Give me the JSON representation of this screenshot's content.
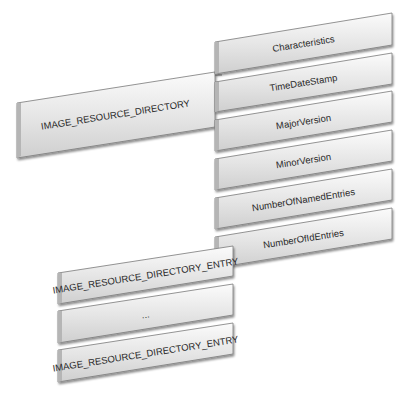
{
  "diagram": {
    "root": {
      "label": "IMAGE_RESOURCE_DIRECTORY"
    },
    "fields": [
      {
        "label": "Characteristics"
      },
      {
        "label": "TimeDateStamp"
      },
      {
        "label": "MajorVersion"
      },
      {
        "label": "MinorVersion"
      },
      {
        "label": "NumberOfNamedEntries"
      },
      {
        "label": "NumberOfIdEntries"
      }
    ],
    "entries": [
      {
        "label": "IMAGE_RESOURCE_DIRECTORY_ENTRY"
      },
      {
        "label": "..."
      },
      {
        "label": "IMAGE_RESOURCE_DIRECTORY_ENTRY"
      }
    ]
  },
  "colors": {
    "box_light": "#f4f4f4",
    "box_mid": "#dcdcdc",
    "box_dark": "#9a9a9a",
    "edge": "#6e6e6e"
  }
}
